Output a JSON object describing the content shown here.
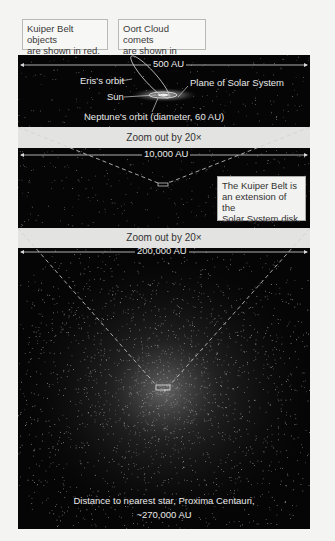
{
  "legend": {
    "kuiper_note": [
      "Kuiper Belt objects",
      "are shown in red."
    ],
    "oort_note": [
      "Oort Cloud comets",
      "are shown in green."
    ]
  },
  "panel_top": {
    "scale_label": "500 AU",
    "labels": {
      "eris": "Eris's orbit",
      "plane": "Plane of Solar System",
      "sun": "Sun",
      "neptune": "Neptune's orbit (diameter, 60 AU)"
    }
  },
  "band_1": {
    "label": "Zoom out by 20×"
  },
  "panel_middle": {
    "scale_label": "10,000 AU",
    "note": [
      "The Kuiper Belt is",
      "an extension of the",
      "Solar System disk."
    ]
  },
  "band_2": {
    "label": "Zoom out by 20×"
  },
  "panel_bottom": {
    "scale_label": "200,000 AU",
    "caption": [
      "Distance to nearest star, Proxima Centauri,",
      "~270,000 AU"
    ]
  },
  "colors": {
    "panel_bg": "#050505",
    "band_bg": "#e3e3e1",
    "page_bg": "#f4f4f2",
    "label_text": "#e8e8e8"
  }
}
